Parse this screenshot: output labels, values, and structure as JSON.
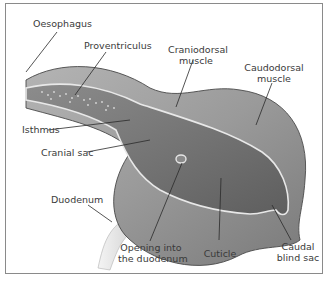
{
  "diagram": {
    "type": "anatomical",
    "labels": {
      "oesophagus": "Oesophagus",
      "proventriculus": "Proventriculus",
      "craniodorsal_1": "Craniodorsal",
      "craniodorsal_2": "muscle",
      "caudodorsal_1": "Caudodorsal",
      "caudodorsal_2": "muscle",
      "isthmus": "Isthmus",
      "cranial_sac": "Cranial sac",
      "duodenum": "Duodenum",
      "opening_1": "Opening into",
      "opening_2": "the duodenum",
      "cuticle": "Cuticle",
      "caudal_1": "Caudal",
      "caudal_2": "blind sac"
    },
    "colors": {
      "muscle_outer": "#9a9a9a",
      "muscle_dark": "#6e6e6e",
      "lumen": "#7d7d7d",
      "cuticle_line": "#e8e8e8",
      "outline": "#4a4a4a",
      "leader": "#2a2a2a",
      "border": "#8a8a8a"
    }
  }
}
